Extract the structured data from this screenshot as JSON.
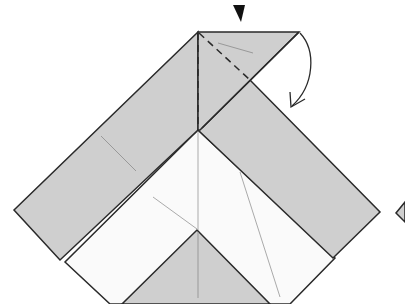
{
  "diagram": {
    "type": "origami-fold-step",
    "colors": {
      "paper_colored": "#cfcfcf",
      "paper_white": "#fafafa",
      "outline": "#2a2a2a",
      "crease": "#999999",
      "background": "#ffffff"
    },
    "symbols": {
      "push_arrow": "black-triangle-pointer",
      "fold_arrow": "curved-arrow-down",
      "fold_lines": "dashed-valley-fold"
    }
  }
}
